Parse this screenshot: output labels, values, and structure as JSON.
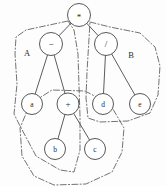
{
  "diagram": {
    "type": "expression-tree",
    "background_color": "#fdfdfd",
    "stroke_color": "#454545",
    "partition_color": "#5a5a5a",
    "nodes": [
      {
        "id": "root",
        "label": "*",
        "kind": "operator",
        "cx": 79,
        "cy": 15,
        "r": 11.5
      },
      {
        "id": "minus",
        "label": "−",
        "kind": "operator",
        "cx": 51,
        "cy": 44,
        "r": 11.5
      },
      {
        "id": "div",
        "label": "/",
        "kind": "operator",
        "cx": 106,
        "cy": 44,
        "r": 11.5
      },
      {
        "id": "a",
        "label": "a",
        "kind": "leaf",
        "cx": 32,
        "cy": 104,
        "r": 10.5
      },
      {
        "id": "plus",
        "label": "+",
        "kind": "operator",
        "cx": 68,
        "cy": 104,
        "r": 11.0
      },
      {
        "id": "d",
        "label": "d",
        "kind": "leaf",
        "cx": 103,
        "cy": 104,
        "r": 10.5
      },
      {
        "id": "e",
        "label": "e",
        "kind": "leaf",
        "cx": 140,
        "cy": 104,
        "r": 10.5
      },
      {
        "id": "b",
        "label": "b",
        "kind": "leaf",
        "cx": 55,
        "cy": 149,
        "r": 10.5
      },
      {
        "id": "c",
        "label": "c",
        "kind": "leaf",
        "cx": 95,
        "cy": 149,
        "r": 10.5
      }
    ],
    "edges": [
      {
        "from": "root",
        "to": "minus"
      },
      {
        "from": "root",
        "to": "div"
      },
      {
        "from": "minus",
        "to": "a"
      },
      {
        "from": "minus",
        "to": "plus"
      },
      {
        "from": "div",
        "to": "d"
      },
      {
        "from": "div",
        "to": "e"
      },
      {
        "from": "plus",
        "to": "b"
      },
      {
        "from": "plus",
        "to": "c"
      }
    ],
    "regions": [
      {
        "id": "region-a",
        "label": "A",
        "label_x": 27,
        "label_y": 53,
        "path": "M 68 21 L 26 30 L 16 37 L 15 54 L 17 84 L 14 114 L 19 124 L 36 156 L 60 170 L 74 172 L 80 150 L 80 116 L 79 86 L 78 54 L 74 30 Z"
      },
      {
        "id": "region-b",
        "label": "B",
        "label_x": 131,
        "label_y": 55,
        "path": "M 90 22 L 110 27 L 140 33 L 155 47 L 160 66 L 158 95 L 150 113 L 128 121 L 100 122 L 88 118 L 86 98 L 87 72 Z"
      },
      {
        "id": "region-lower",
        "label": "",
        "label_x": 0,
        "label_y": 0,
        "path": "M 85 91 L 110 104 L 124 128 L 122 152 L 112 172 L 86 184 L 54 185 L 34 176 L 22 156 L 20 128 L 30 104 L 52 90 Z"
      }
    ],
    "expression": "(a − (b + c)) * (d / e)"
  }
}
